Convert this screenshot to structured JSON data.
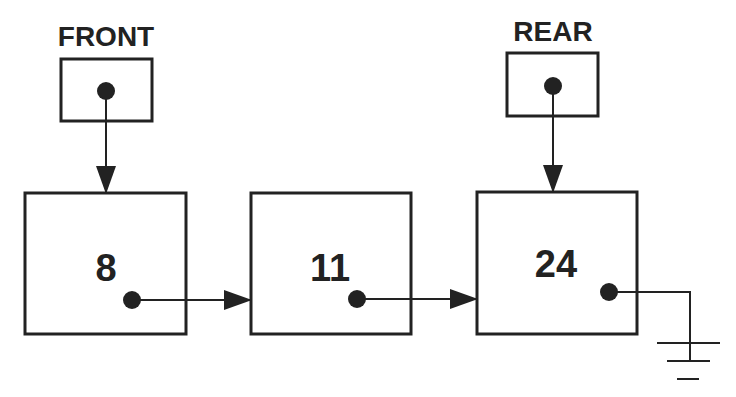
{
  "diagram": {
    "pointers": {
      "front": {
        "label": "FRONT"
      },
      "rear": {
        "label": "REAR"
      }
    },
    "nodes": [
      {
        "value": "8"
      },
      {
        "value": "11"
      },
      {
        "value": "24"
      }
    ],
    "terminator": "ground-null-symbol",
    "colors": {
      "stroke": "#222222",
      "background": "#ffffff"
    }
  }
}
